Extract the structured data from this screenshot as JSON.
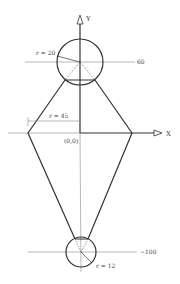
{
  "diagram": {
    "type": "geometry-construction",
    "axes": {
      "x_label": "X",
      "y_label": "Y",
      "origin_label": "(0,0)"
    },
    "upper_circle": {
      "radius_label": "r = 20",
      "center_y_label": "60"
    },
    "lower_circle": {
      "radius_label": "r = 12",
      "center_y_label": "−100"
    },
    "side_point": {
      "distance_label": "r = 45"
    },
    "colors": {
      "stroke": "#333333",
      "thin": "#777777",
      "background": "#ffffff"
    }
  }
}
